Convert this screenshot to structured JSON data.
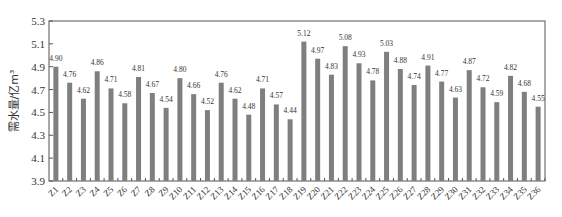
{
  "chart_data": {
    "type": "bar",
    "title": "",
    "xlabel": "",
    "ylabel": "需水量/亿m³",
    "ylim": [
      3.9,
      5.3
    ],
    "yticks": [
      3.9,
      4.1,
      4.3,
      4.5,
      4.7,
      4.9,
      5.1,
      5.3
    ],
    "grid": false,
    "legend": null,
    "bar_color": "#7f7f7f",
    "categories": [
      "Z1",
      "Z2",
      "Z3",
      "Z4",
      "Z5",
      "Z6",
      "Z7",
      "Z8",
      "Z9",
      "Z10",
      "Z11",
      "Z12",
      "Z13",
      "Z14",
      "Z15",
      "Z16",
      "Z17",
      "Z18",
      "Z19",
      "Z20",
      "Z21",
      "Z22",
      "Z23",
      "Z24",
      "Z25",
      "Z26",
      "Z27",
      "Z28",
      "Z29",
      "Z30",
      "Z31",
      "Z32",
      "Z33",
      "Z34",
      "Z35",
      "Z36"
    ],
    "values": [
      4.9,
      4.76,
      4.62,
      4.86,
      4.71,
      4.58,
      4.81,
      4.67,
      4.54,
      4.8,
      4.66,
      4.52,
      4.76,
      4.62,
      4.48,
      4.71,
      4.57,
      4.44,
      5.12,
      4.97,
      4.83,
      5.08,
      4.93,
      4.78,
      5.03,
      4.88,
      4.74,
      4.91,
      4.77,
      4.63,
      4.87,
      4.72,
      4.59,
      4.82,
      4.68,
      4.55
    ],
    "value_labels": [
      "4.90",
      "4.76",
      "4.62",
      "4.86",
      "4.71",
      "4.58",
      "4.81",
      "4.67",
      "4.54",
      "4.80",
      "4.66",
      "4.52",
      "4.76",
      "4.62",
      "4.48",
      "4.71",
      "4.57",
      "4.44",
      "5.12",
      "4.97",
      "4.83",
      "5.08",
      "4.93",
      "4.78",
      "5.03",
      "4.88",
      "4.74",
      "4.91",
      "4.77",
      "4.63",
      "4.87",
      "4.72",
      "4.59",
      "4.82",
      "4.68",
      "4.55"
    ]
  }
}
